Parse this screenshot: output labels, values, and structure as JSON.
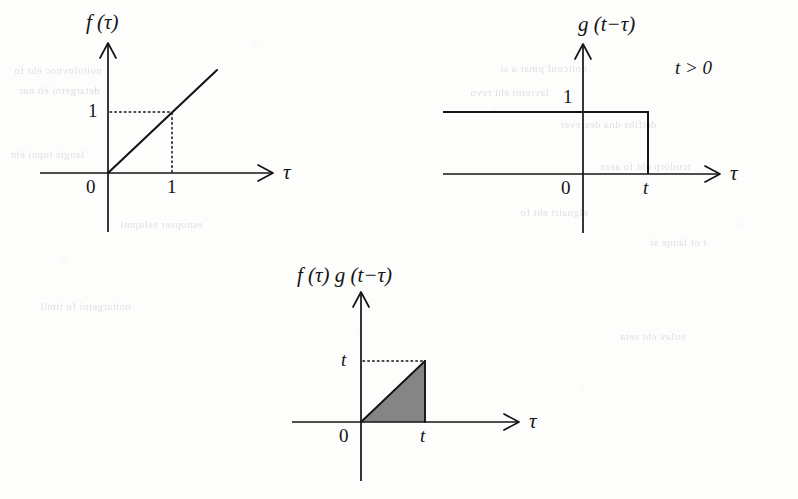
{
  "figure": {
    "background_color": "#fdfdfc",
    "ink_color": "#141414",
    "shade_color": "#858585"
  },
  "plots": [
    {
      "id": "plot-ramp",
      "name": "f-tau-ramp-plot",
      "ylabel": "f (τ)",
      "xaxis_label": "τ",
      "origin_label": "0",
      "yticks": [
        {
          "label": "1",
          "value": 1
        }
      ],
      "xticks": [
        {
          "label": "1",
          "value": 1
        }
      ],
      "guides": "dotted",
      "chart_data": {
        "type": "line",
        "title": "f (τ)",
        "xlabel": "τ",
        "ylabel": "f (τ)",
        "x": [
          0,
          1,
          1.7
        ],
        "y": [
          0,
          1,
          1.7
        ],
        "xlim": [
          -1.1,
          2.6
        ],
        "ylim": [
          -0.75,
          2.1
        ],
        "grid": false,
        "legend": "none",
        "annotations": [
          {
            "text": "1",
            "x": 0,
            "y": 1,
            "placement": "y-axis-tick"
          },
          {
            "text": "1",
            "x": 1,
            "y": 0,
            "placement": "x-axis-tick"
          },
          {
            "text": "0",
            "x": 0,
            "y": 0,
            "placement": "origin"
          }
        ],
        "description": "Unit-slope ramp f(τ)=τ for τ≥0, zero for τ<0; dotted guide lines mark the point (1,1)."
      }
    },
    {
      "id": "plot-step",
      "name": "g-t-minus-tau-step-plot",
      "ylabel": "g (t−τ)",
      "xaxis_label": "τ",
      "origin_label": "0",
      "condition": "t > 0",
      "yticks": [
        {
          "label": "1",
          "value": 1
        }
      ],
      "xticks": [
        {
          "label": "t",
          "value": 1
        }
      ],
      "chart_data": {
        "type": "line",
        "title": "g (t−τ)",
        "xlabel": "τ",
        "ylabel": "g (t−τ)",
        "x": [
          -2.2,
          1.0,
          1.0,
          2.35
        ],
        "y": [
          1,
          1,
          0,
          0
        ],
        "xlim": [
          -2.2,
          2.35
        ],
        "ylim": [
          -0.75,
          2.1
        ],
        "grid": false,
        "legend": "none",
        "annotations": [
          {
            "text": "1",
            "x": 0,
            "y": 1,
            "placement": "y-axis-tick"
          },
          {
            "text": "t",
            "x": 1,
            "y": 0,
            "placement": "x-axis-tick"
          },
          {
            "text": "0",
            "x": 0,
            "y": 0,
            "placement": "origin"
          },
          {
            "text": "t > 0",
            "x": 1.55,
            "y": 1.75,
            "placement": "free"
          }
        ],
        "description": "Time-reversed, shifted unit step equal to 1 for τ < t and 0 for τ > t."
      }
    },
    {
      "id": "plot-product",
      "name": "product-triangle-plot",
      "ylabel": "f (τ) g (t−τ)",
      "xaxis_label": "τ",
      "origin_label": "0",
      "yticks": [
        {
          "label": "t",
          "value": 1
        }
      ],
      "xticks": [
        {
          "label": "t",
          "value": 1
        }
      ],
      "shaded": true,
      "chart_data": {
        "type": "area",
        "title": "f (τ) g (t−τ)",
        "xlabel": "τ",
        "ylabel": "f (τ) g (t−τ)",
        "x": [
          0,
          1,
          1
        ],
        "y": [
          0,
          1,
          0
        ],
        "xlim": [
          -1.0,
          2.6
        ],
        "ylim": [
          -0.75,
          2.0
        ],
        "grid": false,
        "legend": "none",
        "fill_color": "#858585",
        "annotations": [
          {
            "text": "t",
            "x": 0,
            "y": 1,
            "placement": "y-axis-tick"
          },
          {
            "text": "t",
            "x": 1,
            "y": 0,
            "placement": "x-axis-tick"
          },
          {
            "text": "0",
            "x": 0,
            "y": 0,
            "placement": "origin"
          }
        ],
        "description": "Shaded right triangle of base t and height t: the product f(τ)g(t−τ) nonzero only on 0<τ<t; dotted guide at height t."
      }
    }
  ],
  "ghost_marks": [
    {
      "text": "noitulovnoc eht fo",
      "x": 14,
      "y": 64
    },
    {
      "text": "detargetni eb nac",
      "x": 18,
      "y": 84
    },
    {
      "text": "langis tupni eht",
      "x": 10,
      "y": 148
    },
    {
      "text": "esnopser eslupmi",
      "x": 120,
      "y": 218
    },
    {
      "text": "noitcnuf pmar a si",
      "x": 500,
      "y": 62
    },
    {
      "text": "lavretni eht revo",
      "x": 470,
      "y": 86
    },
    {
      "text": "detfihs dna desrever",
      "x": 560,
      "y": 118
    },
    {
      "text": "tcudorp eht fo aera",
      "x": 600,
      "y": 160
    },
    {
      "text": "elgnairt eht fo",
      "x": 520,
      "y": 206
    },
    {
      "text": "t ot lauqe si",
      "x": 650,
      "y": 236
    },
    {
      "text": "noitargetni fo timil",
      "x": 40,
      "y": 300
    },
    {
      "text": "eulav eht seta",
      "x": 620,
      "y": 330
    }
  ]
}
